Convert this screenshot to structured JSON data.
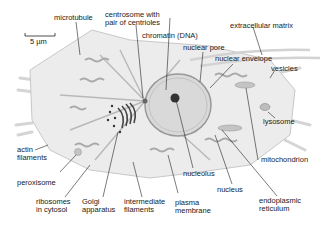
{
  "figure": {
    "scale_bar": "5 µm",
    "labels": {
      "microtubule": "microtubule",
      "centrosome_line1": "centrosome with",
      "centrosome_line2": "pair of centrioles",
      "chromatin": "chromatin (DNA)",
      "nuclear_pore": "nuclear pore",
      "extracellular_matrix": "extracellular matrix",
      "nuclear_envelope": "nuclear envelope",
      "vesicles": "vesicles",
      "lysosome": "lysosome",
      "mitochondrion": "mitochondrion",
      "actin_line1": "actin",
      "actin_line2": "filaments",
      "peroxisome": "peroxisome",
      "ribosomes_line1": "ribosomes",
      "ribosomes_line2": "in cytosol",
      "golgi_line1": "Golgi",
      "golgi_line2": "apparatus",
      "intermediate_line1": "intermediate",
      "intermediate_line2": "filaments",
      "plasma_line1": "plasma",
      "plasma_line2": "membrane",
      "nucleolus": "nucleolus",
      "nucleus": "nucleus",
      "er_line1": "endoplasmic",
      "er_line2": "reticulum"
    },
    "colors": {
      "cytoplasm": "#ececec",
      "nucleus": "#d9d9d9",
      "organelle": "#bdbdbd",
      "dark": "#333333"
    }
  }
}
